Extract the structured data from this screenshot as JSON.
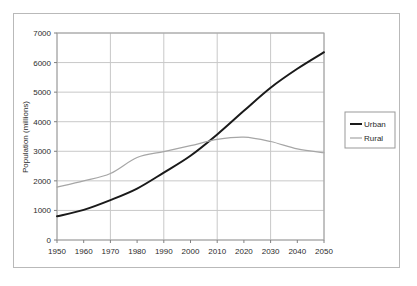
{
  "chart_data": {
    "type": "line",
    "title": "",
    "xlabel": "",
    "ylabel": "Population (millions)",
    "xlim": [
      1950,
      2050
    ],
    "ylim": [
      0,
      7000
    ],
    "grid": true,
    "legend_position": "right",
    "x": [
      1950,
      1960,
      1970,
      1980,
      1990,
      2000,
      2010,
      2020,
      2030,
      2040,
      2050
    ],
    "xticks": [
      "1950",
      "1960",
      "1970",
      "1980",
      "1990",
      "2000",
      "2010",
      "2020",
      "2030",
      "2040",
      "2050"
    ],
    "yticks": [
      "0",
      "1000",
      "2000",
      "3000",
      "4000",
      "5000",
      "6000",
      "7000"
    ],
    "ytick_values": [
      0,
      1000,
      2000,
      3000,
      4000,
      5000,
      6000,
      7000
    ],
    "vertical_gridline_years": [
      1950,
      1970,
      1990,
      2010,
      2030,
      2050
    ],
    "series": [
      {
        "name": "Urban",
        "color": "#1a1a1a",
        "width": 2.0,
        "values": [
          800,
          1020,
          1350,
          1740,
          2280,
          2850,
          3570,
          4370,
          5150,
          5790,
          6350
        ]
      },
      {
        "name": "Rural",
        "color": "#a6a6a6",
        "width": 1.2,
        "values": [
          1790,
          2000,
          2250,
          2790,
          2990,
          3190,
          3400,
          3480,
          3330,
          3080,
          2950
        ]
      }
    ],
    "annotations": {
      "crossover_year": 2007,
      "crossover_value": 3350
    }
  },
  "legend": {
    "items": [
      {
        "label": "Urban"
      },
      {
        "label": "Rural"
      }
    ]
  },
  "colors": {
    "urban": "#1a1a1a",
    "rural": "#a6a6a6",
    "grid": "#c8c8c8",
    "axis": "#808080",
    "frame": "#b9b9b9",
    "text": "#2b2b2b",
    "background": "#ffffff"
  }
}
